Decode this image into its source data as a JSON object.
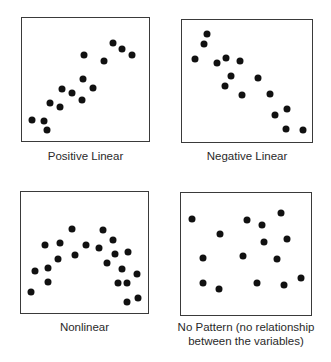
{
  "figure": {
    "panels": [
      {
        "id": "positive-linear",
        "caption": "Positive Linear",
        "box": {
          "x": 21,
          "y": 17,
          "w": 129,
          "h": 125
        },
        "caption_pos": {
          "x": 21,
          "y": 149,
          "w": 129
        },
        "points": [
          [
            32,
            120
          ],
          [
            44,
            121
          ],
          [
            47,
            130
          ],
          [
            50,
            103
          ],
          [
            60,
            107
          ],
          [
            62,
            89
          ],
          [
            72,
            93
          ],
          [
            82,
            100
          ],
          [
            83,
            79
          ],
          [
            93,
            88
          ],
          [
            84,
            55
          ],
          [
            104,
            61
          ],
          [
            113,
            43
          ],
          [
            122,
            49
          ],
          [
            132,
            55
          ]
        ]
      },
      {
        "id": "negative-linear",
        "caption": "Negative Linear",
        "box": {
          "x": 181,
          "y": 19,
          "w": 132,
          "h": 124
        },
        "caption_pos": {
          "x": 181,
          "y": 149,
          "w": 132
        },
        "points": [
          [
            207,
            34
          ],
          [
            204,
            44
          ],
          [
            195,
            59
          ],
          [
            217,
            63
          ],
          [
            226,
            58
          ],
          [
            240,
            61
          ],
          [
            231,
            76
          ],
          [
            225,
            86
          ],
          [
            258,
            78
          ],
          [
            242,
            95
          ],
          [
            270,
            94
          ],
          [
            287,
            109
          ],
          [
            275,
            115
          ],
          [
            286,
            129
          ],
          [
            303,
            130
          ]
        ]
      },
      {
        "id": "nonlinear",
        "caption": "Nonlinear",
        "box": {
          "x": 20,
          "y": 191,
          "w": 129,
          "h": 123
        },
        "caption_pos": {
          "x": 20,
          "y": 320,
          "w": 129
        },
        "points": [
          [
            31,
            292
          ],
          [
            35,
            271
          ],
          [
            45,
            245
          ],
          [
            48,
            268
          ],
          [
            48,
            282
          ],
          [
            58,
            259
          ],
          [
            60,
            243
          ],
          [
            72,
            229
          ],
          [
            75,
            255
          ],
          [
            86,
            245
          ],
          [
            99,
            248
          ],
          [
            103,
            230
          ],
          [
            107,
            263
          ],
          [
            113,
            240
          ],
          [
            115,
            254
          ],
          [
            122,
            269
          ],
          [
            128,
            252
          ],
          [
            118,
            283
          ],
          [
            127,
            283
          ],
          [
            137,
            274
          ],
          [
            127,
            302
          ],
          [
            138,
            298
          ]
        ]
      },
      {
        "id": "no-pattern",
        "caption": "No Pattern (no relationship between the variables)",
        "caption_lines": [
          "No Pattern (no relationship",
          "between the variables)"
        ],
        "box": {
          "x": 180,
          "y": 192,
          "w": 132,
          "h": 124
        },
        "caption_pos": {
          "x": 166,
          "y": 320,
          "w": 160
        },
        "points": [
          [
            192,
            219
          ],
          [
            220,
            234
          ],
          [
            203,
            258
          ],
          [
            203,
            283
          ],
          [
            219,
            289
          ],
          [
            247,
            220
          ],
          [
            262,
            225
          ],
          [
            281,
            213
          ],
          [
            264,
            242
          ],
          [
            287,
            239
          ],
          [
            243,
            256
          ],
          [
            277,
            259
          ],
          [
            257,
            283
          ],
          [
            284,
            285
          ],
          [
            301,
            278
          ]
        ]
      }
    ],
    "colors": {
      "dot": "#111111",
      "border": "#3a3a3a",
      "text": "#2a2a2a",
      "background": "#ffffff"
    }
  },
  "chart_data": [
    {
      "type": "scatter",
      "title": "Positive Linear",
      "xlabel": "",
      "ylabel": "",
      "grid": false,
      "points_px": [
        [
          32,
          120
        ],
        [
          44,
          121
        ],
        [
          47,
          130
        ],
        [
          50,
          103
        ],
        [
          60,
          107
        ],
        [
          62,
          89
        ],
        [
          72,
          93
        ],
        [
          82,
          100
        ],
        [
          83,
          79
        ],
        [
          93,
          88
        ],
        [
          84,
          55
        ],
        [
          104,
          61
        ],
        [
          113,
          43
        ],
        [
          122,
          49
        ],
        [
          132,
          55
        ]
      ]
    },
    {
      "type": "scatter",
      "title": "Negative Linear",
      "xlabel": "",
      "ylabel": "",
      "grid": false,
      "points_px": [
        [
          207,
          34
        ],
        [
          204,
          44
        ],
        [
          195,
          59
        ],
        [
          217,
          63
        ],
        [
          226,
          58
        ],
        [
          240,
          61
        ],
        [
          231,
          76
        ],
        [
          225,
          86
        ],
        [
          258,
          78
        ],
        [
          242,
          95
        ],
        [
          270,
          94
        ],
        [
          287,
          109
        ],
        [
          275,
          115
        ],
        [
          286,
          129
        ],
        [
          303,
          130
        ]
      ]
    },
    {
      "type": "scatter",
      "title": "Nonlinear",
      "xlabel": "",
      "ylabel": "",
      "grid": false,
      "points_px": [
        [
          31,
          292
        ],
        [
          35,
          271
        ],
        [
          45,
          245
        ],
        [
          48,
          268
        ],
        [
          48,
          282
        ],
        [
          58,
          259
        ],
        [
          60,
          243
        ],
        [
          72,
          229
        ],
        [
          75,
          255
        ],
        [
          86,
          245
        ],
        [
          99,
          248
        ],
        [
          103,
          230
        ],
        [
          107,
          263
        ],
        [
          113,
          240
        ],
        [
          115,
          254
        ],
        [
          122,
          269
        ],
        [
          128,
          252
        ],
        [
          118,
          283
        ],
        [
          127,
          283
        ],
        [
          137,
          274
        ],
        [
          127,
          302
        ],
        [
          138,
          298
        ]
      ]
    },
    {
      "type": "scatter",
      "title": "No Pattern (no relationship between the variables)",
      "xlabel": "",
      "ylabel": "",
      "grid": false,
      "points_px": [
        [
          192,
          219
        ],
        [
          220,
          234
        ],
        [
          203,
          258
        ],
        [
          203,
          283
        ],
        [
          219,
          289
        ],
        [
          247,
          220
        ],
        [
          262,
          225
        ],
        [
          281,
          213
        ],
        [
          264,
          242
        ],
        [
          287,
          239
        ],
        [
          243,
          256
        ],
        [
          277,
          259
        ],
        [
          257,
          283
        ],
        [
          284,
          285
        ],
        [
          301,
          278
        ]
      ]
    }
  ]
}
